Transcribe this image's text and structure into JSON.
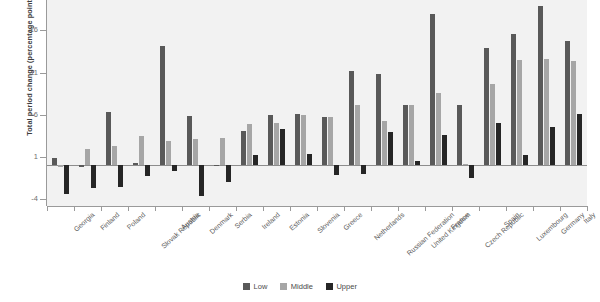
{
  "chart_data": {
    "type": "bar",
    "title": "",
    "subtitle": "",
    "xlabel": "",
    "ylabel": "Total period change (percentage points)",
    "ylim": [
      -4.8,
      19.6
    ],
    "yticks": [
      -4,
      1,
      6,
      11,
      16
    ],
    "ytick_labels": [
      "-4",
      "1",
      "6",
      "11",
      "16"
    ],
    "grid": false,
    "legend_position": "bottom",
    "categories": [
      "Georgia",
      "Finland",
      "Poland",
      "Slovak Republic",
      "Austria",
      "Denmark",
      "Serbia",
      "Ireland",
      "Estonia",
      "Slovenia",
      "Greece",
      "Netherlands",
      "Russian Federation",
      "United Kingdom",
      "France",
      "Czech Republic",
      "Spain",
      "Luxembourg",
      "Germany",
      "Italy"
    ],
    "series": [
      {
        "name": "Low",
        "color": "#595959",
        "values": [
          0.9,
          -0.2,
          6.3,
          0.3,
          14.1,
          5.9,
          0.1,
          4.1,
          6.0,
          6.1,
          5.7,
          11.2,
          10.8,
          7.2,
          17.9,
          7.2,
          13.9,
          15.6,
          18.9,
          14.7
        ]
      },
      {
        "name": "Middle",
        "color": "#a6a6a6",
        "values": [
          -0.1,
          1.9,
          2.3,
          3.5,
          2.9,
          3.1,
          3.3,
          4.9,
          5.0,
          6.0,
          5.8,
          7.2,
          5.3,
          7.2,
          8.6,
          0.2,
          9.6,
          12.5,
          12.6,
          12.4
        ]
      },
      {
        "name": "Upper",
        "color": "#262626",
        "values": [
          -3.4,
          -2.7,
          -2.6,
          -1.3,
          -0.7,
          -3.6,
          -1.9,
          1.3,
          4.3,
          1.4,
          -1.1,
          -1.0,
          4.0,
          0.5,
          3.6,
          -1.5,
          5.0,
          1.2,
          4.6,
          6.1
        ]
      }
    ]
  },
  "legend": {
    "items": [
      {
        "label": "Low",
        "color": "#595959"
      },
      {
        "label": "Middle",
        "color": "#a6a6a6"
      },
      {
        "label": "Upper",
        "color": "#262626"
      }
    ]
  }
}
